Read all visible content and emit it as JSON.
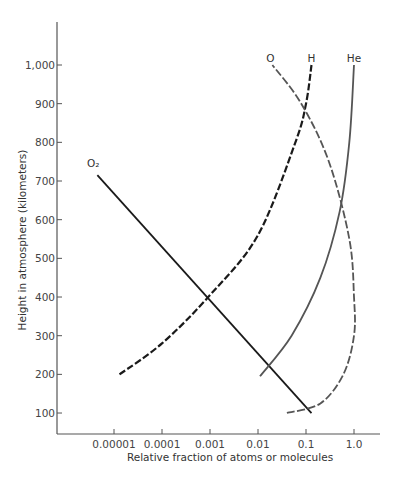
{
  "chart_data": {
    "type": "line",
    "title": "",
    "xlabel": "Relative fraction of atoms or molecules",
    "ylabel": "Height in atmosphere  (kilometers)",
    "xscale": "log",
    "xlim": [
      1.5e-06,
      3.5
    ],
    "ylim": [
      45,
      1180
    ],
    "grid": false,
    "legend": "inline labels at line ends",
    "x_ticks": [
      1e-05,
      0.0001,
      0.001,
      0.01,
      0.1,
      1.0
    ],
    "x_tick_labels": [
      "0.00001",
      "0.0001",
      "0.001",
      "0.01",
      "0.1",
      "1.0"
    ],
    "y_ticks": [
      100,
      200,
      300,
      400,
      500,
      600,
      700,
      800,
      900,
      1000
    ],
    "y_tick_labels": [
      "100",
      "200",
      "300",
      "400",
      "500",
      "600",
      "700",
      "800",
      "900",
      "1,000"
    ],
    "series": [
      {
        "name": "O2",
        "label": "O₂",
        "style": "solid",
        "color": "#1a1a1a",
        "points": [
          [
            4.5e-06,
            715
          ],
          [
            0.0001,
            555
          ],
          [
            0.001,
            410
          ],
          [
            0.01,
            255
          ],
          [
            0.13,
            100
          ]
        ]
      },
      {
        "name": "H",
        "label": "H",
        "style": "dashed",
        "color": "#1a1a1a",
        "points": [
          [
            1.3e-05,
            200
          ],
          [
            0.0001,
            280
          ],
          [
            0.001,
            405
          ],
          [
            0.01,
            560
          ],
          [
            0.06,
            800
          ],
          [
            0.1,
            900
          ],
          [
            0.13,
            1000
          ]
        ]
      },
      {
        "name": "He",
        "label": "He",
        "style": "solid",
        "color": "#555555",
        "points": [
          [
            0.011,
            195
          ],
          [
            0.05,
            300
          ],
          [
            0.2,
            450
          ],
          [
            0.5,
            620
          ],
          [
            0.8,
            800
          ],
          [
            1.0,
            1000
          ]
        ]
      },
      {
        "name": "O",
        "label": "O",
        "style": "dashed",
        "color": "#555555",
        "points": [
          [
            0.04,
            100
          ],
          [
            0.2,
            125
          ],
          [
            0.6,
            200
          ],
          [
            1.0,
            300
          ],
          [
            1.0,
            400
          ],
          [
            0.8,
            550
          ],
          [
            0.3,
            750
          ],
          [
            0.08,
            900
          ],
          [
            0.02,
            1000
          ]
        ]
      }
    ]
  }
}
